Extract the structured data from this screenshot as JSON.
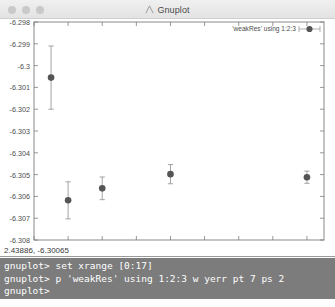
{
  "window": {
    "title": "Gnuplot",
    "icon": "gnuplot-logo-icon",
    "controls": [
      {
        "name": "close-button",
        "color": "#c9c9c9"
      },
      {
        "name": "minimize-button",
        "color": "#c9c9c9"
      },
      {
        "name": "zoom-button",
        "color": "#c9c9c9"
      }
    ]
  },
  "coordinate_readout": {
    "text": "2.43886, -6.30065"
  },
  "terminal": {
    "lines": [
      "gnuplot> set xrange [0:17]",
      "gnuplot> p 'weakRes' using 1:2:3 w yerr pt 7 ps 2",
      "gnuplot>"
    ],
    "background": "#7c7c7c",
    "foreground": "#ffffff"
  },
  "chart_data": {
    "type": "scatter",
    "title": "",
    "xlabel": "",
    "ylabel": "",
    "xlim": [
      0,
      17
    ],
    "ylim": [
      -6.308,
      -6.298
    ],
    "grid": false,
    "legend_position": "top-right",
    "point_style": "filled-circle",
    "point_color": "#555555",
    "errorbar_color": "#9a9a9a",
    "xticks": [
      0,
      2,
      4,
      6,
      8,
      10,
      12,
      14,
      16
    ],
    "xtick_labels": [
      "0",
      "2",
      "4",
      "6",
      "8",
      "10",
      "12",
      "14",
      "16"
    ],
    "yticks": [
      -6.298,
      -6.299,
      -6.3,
      -6.301,
      -6.302,
      -6.303,
      -6.304,
      -6.305,
      -6.306,
      -6.307,
      -6.308
    ],
    "ytick_labels": [
      "-6.298",
      "-6.299",
      "-6.3",
      "-6.301",
      "-6.302",
      "-6.303",
      "-6.304",
      "-6.305",
      "-6.306",
      "-6.307",
      "-6.308"
    ],
    "series": [
      {
        "name": "'weakRes' using 1:2:3",
        "x": [
          1,
          2,
          4,
          8,
          16
        ],
        "y": [
          -6.30055,
          -6.30618,
          -6.30563,
          -6.30498,
          -6.30512
        ],
        "yerr": [
          0.00145,
          0.00085,
          0.00052,
          0.00044,
          0.00028
        ]
      }
    ]
  }
}
